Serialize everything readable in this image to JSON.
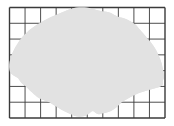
{
  "diagram": {
    "grid": {
      "columns": 10,
      "rows": 7
    },
    "colors": {
      "background": "#ffffff",
      "shape_fill": "#e2e2e2",
      "shape_outline": "#111111",
      "grid_line": "#3a3a3a"
    },
    "shape": {
      "name": "irregular-region",
      "description": "Shaded irregular blob overlaid on square grid"
    }
  }
}
